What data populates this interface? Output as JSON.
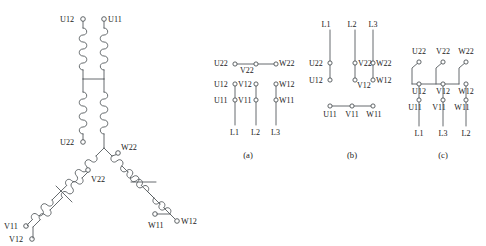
{
  "figure": {
    "line_color": "#555a5e",
    "text_color": "#1a1a1a",
    "background": "#ffffff"
  },
  "schematic": {
    "name": "star-delta-winding-schematic",
    "terminals": [
      {
        "id": "U12",
        "label": "U12"
      },
      {
        "id": "U11",
        "label": "U11"
      },
      {
        "id": "U22",
        "label": "U22"
      },
      {
        "id": "W22",
        "label": "W22"
      },
      {
        "id": "V22",
        "label": "V22"
      },
      {
        "id": "V11",
        "label": "V11"
      },
      {
        "id": "V12",
        "label": "V12"
      },
      {
        "id": "W11",
        "label": "W11"
      },
      {
        "id": "W12",
        "label": "W12"
      }
    ]
  },
  "diagrams": [
    {
      "caption": "(a)",
      "name": "terminal-diagram-a",
      "rows": [
        {
          "name": "row-top",
          "cells": [
            "U22",
            "V22",
            "W22"
          ],
          "bridged": true
        },
        {
          "name": "row-middle",
          "cells": [
            "U12",
            "V12",
            "W12"
          ],
          "bridged": false
        },
        {
          "name": "row-bottom",
          "cells": [
            "U11",
            "V11",
            "W11"
          ],
          "bridged": false
        }
      ],
      "supply": [
        "L1",
        "L2",
        "L3"
      ],
      "supply_position": "bottom"
    },
    {
      "caption": "(b)",
      "name": "terminal-diagram-b",
      "rows": [
        {
          "name": "row-top",
          "cells": [
            "U22",
            "V22",
            "W22"
          ],
          "bridged": false
        },
        {
          "name": "row-middle",
          "cells": [
            "U12",
            "V12",
            "W12"
          ],
          "bridged": false
        },
        {
          "name": "row-bottom",
          "cells": [
            "U11",
            "V11",
            "W11"
          ],
          "bridged": true
        }
      ],
      "supply": [
        "L1",
        "L2",
        "L3"
      ],
      "supply_position": "top"
    },
    {
      "caption": "(c)",
      "name": "terminal-diagram-c",
      "rows": [
        {
          "name": "row-top",
          "cells": [
            "U22",
            "V22",
            "W22"
          ],
          "bridged": false
        },
        {
          "name": "row-middle",
          "cells": [
            "U12",
            "V12",
            "W12"
          ],
          "bridged": true
        },
        {
          "name": "row-bottom",
          "cells": [
            "U11",
            "V11",
            "W11"
          ],
          "bridged": false
        }
      ],
      "supply": [
        "L1",
        "L3",
        "L2"
      ],
      "supply_position": "bottom"
    }
  ],
  "labels": {
    "U11": "U11",
    "U12": "U12",
    "U22": "U22",
    "V11": "V11",
    "V12": "V12",
    "V22": "V22",
    "W11": "W11",
    "W12": "W12",
    "W22": "W22",
    "L1": "L1",
    "L2": "L2",
    "L3": "L3",
    "cap_a": "(a)",
    "cap_b": "(b)",
    "cap_c": "(c)"
  }
}
